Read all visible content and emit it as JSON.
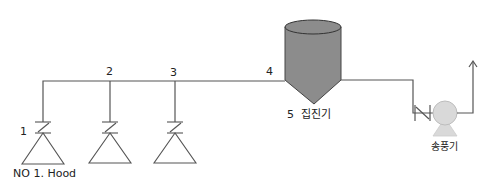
{
  "diagram": {
    "type": "local-exhaust-ventilation-flow",
    "colors": {
      "line": "#555555",
      "collector_fill": "#8c8c8c",
      "collector_stroke": "#444444",
      "fan_fill": "#d9d9d9",
      "fan_stroke": "#bdbdbd",
      "text": "#222222"
    },
    "labels": {
      "point_1": "1",
      "point_2": "2",
      "point_3": "3",
      "point_4": "4",
      "hood": "NO 1. Hood",
      "collector": "5  집진기",
      "fan": "송풍기"
    },
    "nodes": [
      {
        "id": "hood-1",
        "label": "NO 1. Hood",
        "point": "1"
      },
      {
        "id": "hood-2",
        "point": "2"
      },
      {
        "id": "hood-3",
        "point": "3"
      },
      {
        "id": "duct-4",
        "point": "4"
      },
      {
        "id": "collector",
        "label": "5  집진기"
      },
      {
        "id": "fan",
        "label": "송풍기"
      }
    ],
    "edges": [
      [
        "hood-1",
        "duct-4"
      ],
      [
        "hood-2",
        "duct-4"
      ],
      [
        "hood-3",
        "duct-4"
      ],
      [
        "duct-4",
        "collector"
      ],
      [
        "collector",
        "fan"
      ],
      [
        "fan",
        "outlet"
      ]
    ]
  }
}
